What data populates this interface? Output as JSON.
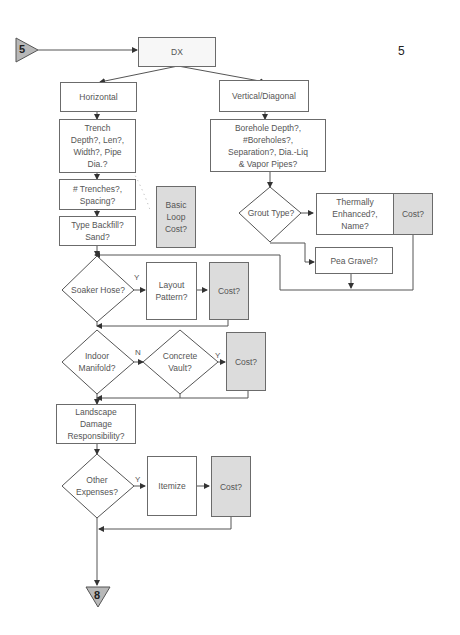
{
  "page_number": "5",
  "connectors": {
    "start": "5",
    "end": "8"
  },
  "nodes": {
    "dx": "DX",
    "horizontal": "Horizontal",
    "vertical": "Vertical/Diagonal",
    "trench": "Trench\nDepth?, Len?,\nWidth?, Pipe\nDia.?",
    "trenches": "# Trenches?,\nSpacing?",
    "backfill": "Type Backfill?\nSand?",
    "basic_loop_cost": "Basic\nLoop\nCost?",
    "borehole": "Borehole Depth?,\n#Boreholes?,\nSeparation?, Dia.-Liq\n& Vapor Pipes?",
    "grout_type": "Grout Type?",
    "thermally": "Thermally\nEnhanced?,\nName?",
    "thermally_cost": "Cost?",
    "pea_gravel": "Pea Gravel?",
    "soaker_hose": "Soaker Hose?",
    "layout_pattern": "Layout\nPattern?",
    "soaker_cost": "Cost?",
    "indoor_manifold": "Indoor\nManifold?",
    "concrete_vault": "Concrete\nVault?",
    "vault_cost": "Cost?",
    "landscape": "Landscape\nDamage\nResponsibility?",
    "other_expenses": "Other\nExpenses?",
    "itemize": "Itemize",
    "other_cost": "Cost?"
  },
  "edge_labels": {
    "soaker_yes": "Y",
    "manifold_no": "N",
    "vault_yes": "Y",
    "other_yes": "Y"
  },
  "colors": {
    "line": "#555555",
    "shaded": "#dcdcdc",
    "connector_fill": "#b8b8b8"
  }
}
